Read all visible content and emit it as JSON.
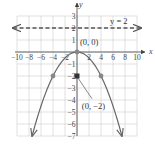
{
  "chart_data": {
    "type": "line",
    "title": "",
    "xlabel": "x",
    "ylabel": "y",
    "xlim": [
      -10,
      10
    ],
    "ylim": [
      -7,
      3
    ],
    "grid": true,
    "grid_x_step": 2,
    "grid_y_step": 1,
    "x_ticks": [
      -10,
      -8,
      -6,
      -4,
      -2,
      2,
      4,
      6,
      8,
      10
    ],
    "x_tick_labels": [
      "−10",
      "−8",
      "−6",
      "−4",
      "−2",
      "2",
      "4",
      "6",
      "8",
      "10"
    ],
    "y_ticks": [
      3,
      2,
      1,
      -1,
      -2,
      -3,
      -4,
      -5,
      -6,
      -7
    ],
    "y_tick_labels": [
      "3",
      "2",
      "1",
      "−1",
      "−2",
      "−3",
      "−4",
      "−5",
      "−6",
      "−7"
    ],
    "series": [
      {
        "name": "parabola",
        "equation": "x^2 = -8y",
        "x": [
          -7.48,
          -6,
          -4,
          -2,
          0,
          2,
          4,
          6,
          7.48
        ],
        "y": [
          -7,
          -4.5,
          -2,
          -0.5,
          0,
          -0.5,
          -2,
          -4.5,
          -7
        ],
        "style": "solid",
        "color": "#666666",
        "arrows": "both-ends"
      },
      {
        "name": "directrix",
        "label": "y = 2",
        "x": [
          -10,
          10
        ],
        "y": [
          2,
          2
        ],
        "style": "dashed",
        "color": "#555555",
        "arrows": "both-ends"
      }
    ],
    "points": [
      {
        "x": 0,
        "y": 0,
        "label": "(0, 0)",
        "color": "#888888",
        "role": "vertex"
      },
      {
        "x": 0,
        "y": -2,
        "label": "(0, −2)",
        "color": "#333333",
        "role": "focus",
        "marker": "square"
      },
      {
        "x": -4,
        "y": -2,
        "color": "#888888"
      },
      {
        "x": 4,
        "y": -2,
        "color": "#888888"
      }
    ],
    "annotations": [
      {
        "text": "y = 2",
        "x": 5.5,
        "y": 2.5
      },
      {
        "text": "(0, 0)",
        "x": 2.5,
        "y": 0.7
      },
      {
        "text": "(0, −2)",
        "x": 4.5,
        "y": -4.7
      }
    ]
  },
  "labels": {
    "x_axis": "x",
    "y_axis": "y",
    "directrix": "y = 2",
    "vertex": "(0, 0)",
    "focus": "(0, −2)"
  }
}
